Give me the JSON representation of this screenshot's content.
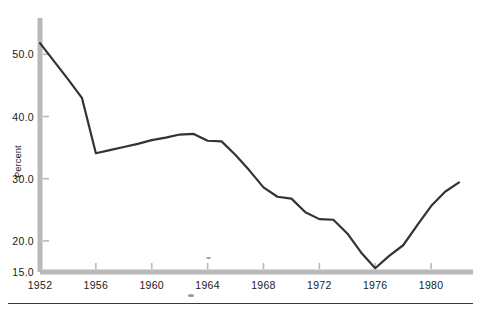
{
  "chart_data": {
    "type": "line",
    "title": "",
    "xlabel": "",
    "ylabel": "Percent",
    "xlim": [
      1952,
      1983
    ],
    "ylim": [
      15.0,
      53.0
    ],
    "grid": false,
    "legend": null,
    "xticks": [
      1952,
      1956,
      1960,
      1964,
      1968,
      1972,
      1976,
      1980
    ],
    "xtick_labels": [
      "1952",
      "1956",
      "1960",
      "1964",
      "1968",
      "1972",
      "1976",
      "1980"
    ],
    "yticks": [
      15.0,
      20.0,
      30.0,
      40.0,
      50.0
    ],
    "ytick_labels": [
      "15.0",
      "20.0",
      "30.0",
      "40.0",
      "50.0"
    ],
    "series": [
      {
        "name": "Percent",
        "color": "#333333",
        "x": [
          1952,
          1953,
          1954,
          1955,
          1956,
          1957,
          1958,
          1959,
          1960,
          1961,
          1962,
          1963,
          1964,
          1965,
          1966,
          1967,
          1968,
          1969,
          1970,
          1971,
          1972,
          1973,
          1974,
          1975,
          1976,
          1977,
          1978,
          1979,
          1980,
          1981,
          1982
        ],
        "values": [
          51.8,
          48.9,
          46.0,
          43.0,
          34.1,
          34.6,
          35.1,
          35.6,
          36.2,
          36.6,
          37.1,
          37.2,
          36.1,
          36.0,
          33.8,
          31.3,
          28.6,
          27.1,
          26.8,
          24.6,
          23.5,
          23.4,
          21.2,
          18.1,
          15.6,
          17.6,
          19.3,
          22.5,
          25.6,
          27.9,
          29.4
        ]
      }
    ]
  },
  "axis": {
    "y_label_text": "Percent",
    "axis_color": "#b5b5b5",
    "line_color": "#333333"
  }
}
